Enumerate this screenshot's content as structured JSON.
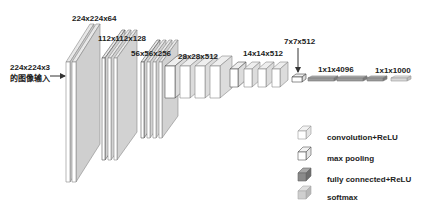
{
  "diagram": {
    "input": {
      "size_label": "224x224x3",
      "desc_label": "的图像输入"
    },
    "stages": [
      {
        "label": "224x224x64",
        "conv_layers": 2,
        "pool": false
      },
      {
        "label": "112x112x128",
        "conv_layers": 2,
        "pool": true
      },
      {
        "label": "56x56x256",
        "conv_layers": 3,
        "pool": true
      },
      {
        "label": "28x28x512",
        "conv_layers": 3,
        "pool": true
      },
      {
        "label": "14x14x512",
        "conv_layers": 3,
        "pool": true
      },
      {
        "label": "7x7x512",
        "conv_layers": 0,
        "pool": true
      }
    ],
    "fc": [
      {
        "label": "1x1x4096",
        "count": 2,
        "type": "fully connected+ReLU"
      },
      {
        "label": "1x1x1000",
        "count": 1,
        "type": "fully connected+ReLU"
      },
      {
        "label": "",
        "count": 1,
        "type": "softmax"
      }
    ],
    "legend": [
      {
        "label": "convolution+ReLU",
        "color": "#ffffff",
        "edge": "#999999"
      },
      {
        "label": "max pooling",
        "color": "#ffffff",
        "edge": "#555555"
      },
      {
        "label": "fully connected+ReLU",
        "color": "#8a8a8a",
        "edge": "#666666"
      },
      {
        "label": "softmax",
        "color": "#cfcfcf",
        "edge": "#aaaaaa"
      }
    ]
  }
}
